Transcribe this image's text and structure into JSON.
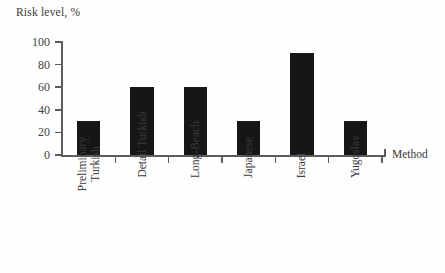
{
  "chart_data": {
    "type": "bar",
    "title": "",
    "xlabel": "Method",
    "ylabel": "Risk level, %",
    "ylim": [
      0,
      100
    ],
    "yticks": [
      0,
      20,
      40,
      60,
      80,
      100
    ],
    "grid": false,
    "legend": null,
    "categories": [
      "Preliminary Turkish",
      "Detail Turkish",
      "Long-Beach",
      "Japanese",
      "Israel",
      "Yugoslav"
    ],
    "category_lines": [
      [
        "Preliminary",
        "Turkish"
      ],
      [
        "Detail Turkish"
      ],
      [
        "Long-Beach"
      ],
      [
        "Japanese"
      ],
      [
        "Israel"
      ],
      [
        "Yugoslav"
      ]
    ],
    "values": [
      30,
      60,
      60,
      30,
      90,
      30
    ],
    "bar_color": "#161616",
    "axis_color": "#5c5c5c"
  }
}
